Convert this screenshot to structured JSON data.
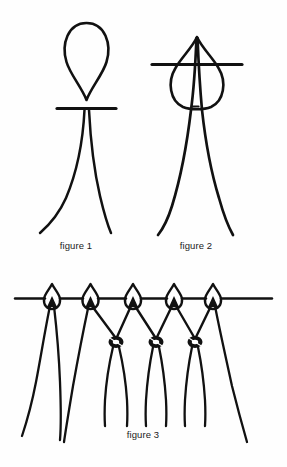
{
  "page": {
    "kind": "line-drawing-diagram",
    "background_color": "#fefefe",
    "ink_color": "#111111",
    "width": 287,
    "height": 467
  },
  "figures": [
    {
      "id": "figure-1",
      "caption": "figure 1",
      "description": "Teardrop cord loop held above a horizontal mounting bar, with the two cord ends splaying downward below the bar.",
      "elements": [
        {
          "name": "cord-loop",
          "shape": "teardrop",
          "point": "down"
        },
        {
          "name": "mounting-bar",
          "shape": "horizontal-line"
        },
        {
          "name": "cord-end-left",
          "shape": "curve"
        },
        {
          "name": "cord-end-right",
          "shape": "curve"
        }
      ]
    },
    {
      "id": "figure-2",
      "caption": "figure 2",
      "description": "The same loop pulled down over the mounting bar so the bar passes through the loop; the two cord ends pass up through the loop and hang down together.",
      "elements": [
        {
          "name": "cord-loop",
          "shape": "teardrop",
          "point": "up"
        },
        {
          "name": "mounting-bar",
          "shape": "horizontal-line"
        },
        {
          "name": "cord-end-left",
          "shape": "curve"
        },
        {
          "name": "cord-end-right",
          "shape": "curve"
        }
      ]
    },
    {
      "id": "figure-3",
      "caption": "figure 3",
      "description": "A row of five mounted loops on the bar; adjacent cords from neighbouring loops are tied together in overhand knots forming a net of diamonds, with loose ends hanging below.",
      "loop_count": 5,
      "knot_count": 3,
      "elements": [
        {
          "name": "mounting-bar",
          "shape": "horizontal-line"
        },
        {
          "name": "mounted-loop",
          "shape": "small-teardrop",
          "count": 5
        },
        {
          "name": "connecting-knot",
          "shape": "overhand-knot",
          "count": 3
        },
        {
          "name": "hanging-cord",
          "shape": "curve",
          "count": 10
        }
      ]
    }
  ],
  "captions": {
    "figure_1": "figure 1",
    "figure_2": "figure 2",
    "figure_3": "figure 3"
  }
}
